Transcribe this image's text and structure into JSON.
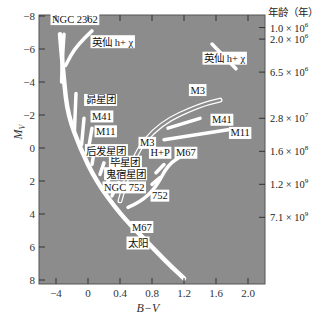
{
  "chart_data": {
    "type": "line",
    "title": "",
    "xlabel": "B−V",
    "ylabel": "M_V",
    "ylabel_main": "M",
    "ylabel_sub": "V",
    "right_axis_title": "年龄（年）",
    "xlim": [
      -0.6,
      2.2
    ],
    "ylim": [
      8,
      -8
    ],
    "x_ticks": [
      -0.4,
      0,
      0.4,
      0.8,
      1.2,
      1.6,
      2.0
    ],
    "x_tick_labels": [
      "−4",
      "0",
      "0.4",
      "0.8",
      "1.2",
      "1.6",
      "2.0"
    ],
    "y_ticks": [
      -8,
      -6,
      -4,
      -2,
      0,
      2,
      4,
      6,
      8
    ],
    "y_tick_labels": [
      "−8",
      "−6",
      "−4",
      "−2",
      "0",
      "2",
      "4",
      "6",
      "8"
    ],
    "background_color": "#8c8c8c",
    "curve_color": "#ffffff",
    "age_scale": [
      {
        "mag": -7.3,
        "label": "1.0 × 10",
        "exp": "6"
      },
      {
        "mag": -6.6,
        "label": "2.0 × 10",
        "exp": "6"
      },
      {
        "mag": -4.6,
        "label": "6.5 × 10",
        "exp": "6"
      },
      {
        "mag": -1.8,
        "label": "2.8 × 10",
        "exp": "7"
      },
      {
        "mag": 0.2,
        "label": "1.6 × 10",
        "exp": "8"
      },
      {
        "mag": 2.2,
        "label": "1.2 × 10",
        "exp": "9"
      },
      {
        "mag": 4.2,
        "label": "7.1 × 10",
        "exp": "9"
      }
    ],
    "series": [
      {
        "name": "main-sequence",
        "points": [
          [
            -0.35,
            -6.9
          ],
          [
            -0.3,
            -4.0
          ],
          [
            -0.25,
            -2.0
          ],
          [
            -0.1,
            0.0
          ],
          [
            0.1,
            2.0
          ],
          [
            0.4,
            4.0
          ],
          [
            0.7,
            5.5
          ],
          [
            1.0,
            7.0
          ],
          [
            1.2,
            7.9
          ]
        ]
      },
      {
        "name": "NGC 2362",
        "points": [
          [
            -0.3,
            -6.9
          ],
          [
            -0.32,
            -5.5
          ],
          [
            -0.33,
            -4.0
          ]
        ]
      },
      {
        "name": "h+chi-Persei-branch",
        "points": [
          [
            0.05,
            -7.1
          ],
          [
            -0.15,
            -6.2
          ],
          [
            -0.28,
            -5.0
          ]
        ]
      },
      {
        "name": "h+chi-Persei-giants",
        "points": [
          [
            1.55,
            -6.3
          ],
          [
            1.85,
            -4.8
          ]
        ]
      },
      {
        "name": "Pleiades",
        "points": [
          [
            -0.15,
            -3.3
          ],
          [
            -0.17,
            -1.0
          ]
        ]
      },
      {
        "name": "M41-turnoff",
        "points": [
          [
            -0.05,
            -1.8
          ],
          [
            -0.08,
            -0.2
          ]
        ]
      },
      {
        "name": "M11-turnoff",
        "points": [
          [
            0.05,
            -1.2
          ],
          [
            0.0,
            0.2
          ]
        ]
      },
      {
        "name": "Coma",
        "points": [
          [
            0.08,
            0.1
          ],
          [
            0.05,
            1.0
          ]
        ]
      },
      {
        "name": "Hyades",
        "points": [
          [
            0.2,
            0.9
          ],
          [
            0.15,
            1.6
          ]
        ]
      },
      {
        "name": "Praesepe",
        "points": [
          [
            0.3,
            1.5
          ],
          [
            0.22,
            2.3
          ]
        ]
      },
      {
        "name": "NGC 752",
        "points": [
          [
            0.38,
            2.1
          ],
          [
            0.3,
            2.9
          ]
        ]
      },
      {
        "name": "M3-RGB",
        "points": [
          [
            0.4,
            3.2
          ],
          [
            0.55,
            0.5
          ],
          [
            0.9,
            -1.5
          ],
          [
            1.4,
            -2.6
          ],
          [
            1.65,
            -2.9
          ]
        ],
        "style": "double"
      },
      {
        "name": "M41-giants",
        "points": [
          [
            1.0,
            -1.2
          ],
          [
            1.4,
            -1.8
          ]
        ]
      },
      {
        "name": "M11-giants",
        "points": [
          [
            0.95,
            -0.5
          ],
          [
            1.75,
            -1.1
          ]
        ]
      },
      {
        "name": "H+P-giants",
        "points": [
          [
            0.85,
            1.5
          ],
          [
            0.95,
            1.0
          ]
        ]
      },
      {
        "name": "752-giants",
        "points": [
          [
            0.8,
            2.2
          ],
          [
            0.9,
            1.8
          ]
        ]
      },
      {
        "name": "M67",
        "points": [
          [
            0.5,
            3.6
          ],
          [
            0.65,
            3.3
          ],
          [
            0.85,
            2.4
          ],
          [
            1.0,
            1.0
          ],
          [
            1.2,
            0.4
          ]
        ]
      }
    ],
    "annotations": [
      {
        "text": "NGC 2362",
        "x": -0.45,
        "y": -7.6
      },
      {
        "text": "英仙 h+ χ",
        "x": 0.05,
        "y": -6.2
      },
      {
        "text": "英仙 h+ χ",
        "x": 1.45,
        "y": -5.2
      },
      {
        "text": "昴星团",
        "x": -0.03,
        "y": -2.7
      },
      {
        "text": "M41",
        "x": 0.05,
        "y": -1.7
      },
      {
        "text": "M11",
        "x": 0.1,
        "y": -0.8
      },
      {
        "text": "后发星团",
        "x": -0.02,
        "y": 0.4
      },
      {
        "text": "毕星团",
        "x": 0.28,
        "y": 1.1
      },
      {
        "text": "鬼宿星团",
        "x": 0.22,
        "y": 1.8
      },
      {
        "text": "NGC 752",
        "x": 0.2,
        "y": 2.6
      },
      {
        "text": "752",
        "x": 0.8,
        "y": 3.1
      },
      {
        "text": "M3",
        "x": 0.65,
        "y": -0.1
      },
      {
        "text": "M3",
        "x": 1.28,
        "y": -3.3
      },
      {
        "text": "H+P",
        "x": 0.78,
        "y": 0.5
      },
      {
        "text": "M41",
        "x": 1.55,
        "y": -1.5
      },
      {
        "text": "M11",
        "x": 1.78,
        "y": -0.7
      },
      {
        "text": "M67",
        "x": 1.1,
        "y": 0.5
      },
      {
        "text": "M67",
        "x": 0.55,
        "y": 5.0
      },
      {
        "text": "太阳",
        "x": 0.5,
        "y": 6.0
      }
    ]
  }
}
